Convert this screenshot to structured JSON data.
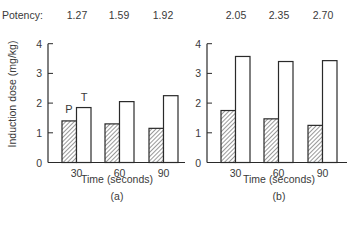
{
  "potency_row": {
    "label": "Potency:",
    "values": [
      "1.27",
      "1.59",
      "1.92",
      "2.05",
      "2.35",
      "2.70"
    ]
  },
  "y_axis_label": "Induction dose (mg/kg)",
  "panels": [
    {
      "x_label": "Time (seconds)",
      "caption": "(a)",
      "bar_labels": {
        "P": "P",
        "T": "T"
      }
    },
    {
      "x_label": "Time (seconds)",
      "caption": "(b)"
    }
  ],
  "chart_data": [
    {
      "type": "bar",
      "title": "(a)",
      "categories": [
        "30",
        "60",
        "90"
      ],
      "series": [
        {
          "name": "P",
          "style": "hatched",
          "values": [
            1.4,
            1.3,
            1.15
          ]
        },
        {
          "name": "T",
          "style": "open",
          "values": [
            1.85,
            2.05,
            2.25
          ]
        }
      ],
      "potency": [
        1.27,
        1.59,
        1.92
      ],
      "xlabel": "Time (seconds)",
      "ylabel": "Induction dose (mg/kg)",
      "ylim": [
        0,
        4
      ],
      "yticks": [
        0,
        1,
        2,
        3,
        4
      ],
      "grid": false,
      "legend": "bar labels P and T above first group"
    },
    {
      "type": "bar",
      "title": "(b)",
      "categories": [
        "30",
        "60",
        "90"
      ],
      "series": [
        {
          "name": "P",
          "style": "hatched",
          "values": [
            1.75,
            1.47,
            1.25
          ]
        },
        {
          "name": "T",
          "style": "open",
          "values": [
            3.57,
            3.4,
            3.43
          ]
        }
      ],
      "potency": [
        2.05,
        2.35,
        2.7
      ],
      "xlabel": "Time (seconds)",
      "ylabel": "Induction dose (mg/kg)",
      "ylim": [
        0,
        4
      ],
      "yticks": [
        0,
        1,
        2,
        3,
        4
      ],
      "grid": false
    }
  ]
}
